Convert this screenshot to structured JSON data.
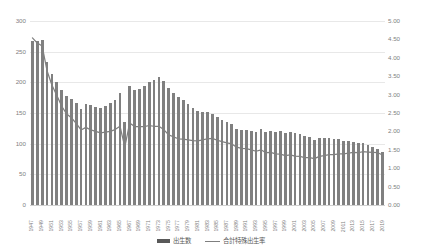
{
  "chart_data": {
    "type": "bar",
    "title": "",
    "subtitle": "",
    "xlabel": "",
    "ylabel": "",
    "y2label": "",
    "grid": true,
    "legend_position": "bottom",
    "ylim": [
      0,
      300
    ],
    "y2lim": [
      0,
      5.0
    ],
    "yticks": [
      "0",
      "50",
      "100",
      "150",
      "200",
      "250",
      "300"
    ],
    "y2ticks": [
      "0.00",
      "0.50",
      "1.00",
      "1.50",
      "2.00",
      "2.50",
      "3.00",
      "3.50",
      "4.00",
      "4.50",
      "5.00"
    ],
    "categories": [
      "1947",
      "1948",
      "1949",
      "1950",
      "1951",
      "1952",
      "1953",
      "1954",
      "1955",
      "1956",
      "1957",
      "1958",
      "1959",
      "1960",
      "1961",
      "1962",
      "1963",
      "1964",
      "1965",
      "1966",
      "1967",
      "1968",
      "1969",
      "1970",
      "1971",
      "1972",
      "1973",
      "1974",
      "1975",
      "1976",
      "1977",
      "1978",
      "1979",
      "1980",
      "1981",
      "1982",
      "1983",
      "1984",
      "1985",
      "1986",
      "1987",
      "1988",
      "1989",
      "1990",
      "1991",
      "1992",
      "1993",
      "1994",
      "1995",
      "1996",
      "1997",
      "1998",
      "1999",
      "2000",
      "2001",
      "2002",
      "2003",
      "2004",
      "2005",
      "2006",
      "2007",
      "2008",
      "2009",
      "2010",
      "2011",
      "2012",
      "2013",
      "2014",
      "2015",
      "2016",
      "2017",
      "2018",
      "2019"
    ],
    "xtick_labels": [
      "1947",
      "1949",
      "1951",
      "1953",
      "1955",
      "1957",
      "1959",
      "1961",
      "1963",
      "1965",
      "1967",
      "1969",
      "1971",
      "1973",
      "1975",
      "1977",
      "1979",
      "1981",
      "1983",
      "1985",
      "1987",
      "1989",
      "1991",
      "1993",
      "1995",
      "1997",
      "1999",
      "2001",
      "2003",
      "2005",
      "2007",
      "2009",
      "2011",
      "2013",
      "2015",
      "2017",
      "2019"
    ],
    "series": [
      {
        "name": "出生数",
        "kind": "bar",
        "axis": "left",
        "unit": "万人",
        "color": "#808080",
        "values": [
          267.9,
          268.2,
          269.7,
          233.8,
          213.8,
          200.5,
          186.8,
          177.0,
          173.1,
          166.5,
          156.7,
          165.3,
          162.6,
          160.6,
          158.9,
          161.9,
          165.9,
          171.7,
          182.4,
          136.0,
          193.6,
          187.2,
          189.0,
          193.4,
          200.1,
          203.9,
          209.2,
          203.0,
          190.1,
          183.3,
          175.5,
          170.9,
          164.3,
          157.7,
          152.9,
          151.5,
          150.9,
          148.9,
          143.2,
          138.2,
          134.7,
          131.4,
          124.7,
          122.2,
          122.3,
          120.9,
          118.9,
          124.0,
          118.7,
          120.7,
          119.2,
          120.3,
          117.8,
          119.1,
          117.1,
          115.4,
          112.4,
          111.1,
          106.3,
          109.3,
          109.0,
          109.1,
          107.0,
          107.1,
          105.1,
          103.7,
          103.0,
          100.4,
          100.6,
          97.7,
          94.6,
          91.8,
          86.5
        ]
      },
      {
        "name": "合計特殊出生率",
        "kind": "line",
        "axis": "right",
        "color": "#808080",
        "values": [
          4.54,
          4.4,
          4.32,
          3.65,
          3.26,
          2.98,
          2.69,
          2.48,
          2.37,
          2.22,
          2.04,
          2.11,
          2.04,
          2.0,
          1.96,
          1.98,
          2.0,
          2.05,
          2.14,
          1.58,
          2.23,
          2.13,
          2.13,
          2.13,
          2.16,
          2.14,
          2.14,
          2.05,
          1.91,
          1.85,
          1.8,
          1.79,
          1.77,
          1.75,
          1.74,
          1.77,
          1.8,
          1.81,
          1.76,
          1.72,
          1.69,
          1.66,
          1.57,
          1.54,
          1.53,
          1.5,
          1.46,
          1.5,
          1.42,
          1.43,
          1.39,
          1.38,
          1.34,
          1.36,
          1.33,
          1.32,
          1.29,
          1.29,
          1.26,
          1.32,
          1.34,
          1.37,
          1.37,
          1.39,
          1.39,
          1.41,
          1.43,
          1.42,
          1.45,
          1.44,
          1.43,
          1.42,
          1.36
        ]
      }
    ],
    "legend": [
      {
        "label": "出生数",
        "marker": "bar",
        "color": "#595959"
      },
      {
        "label": "合計特殊出生率",
        "marker": "line",
        "color": "#7f7f7f"
      }
    ],
    "annotations": []
  }
}
